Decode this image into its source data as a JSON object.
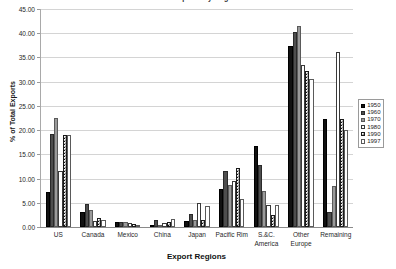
{
  "chart_data": {
    "type": "bar",
    "title": "U.S. Exports by Region",
    "xlabel": "Export Regions",
    "ylabel": "% of Total Exports",
    "ylim": [
      0,
      45
    ],
    "ytick_step": 5,
    "ytick_labels": [
      "0.00",
      "5.00",
      "10.00",
      "15.00",
      "20.00",
      "25.00",
      "30.00",
      "35.00",
      "40.00",
      "45.00"
    ],
    "ytick_values": [
      0,
      5,
      10,
      15,
      20,
      25,
      30,
      35,
      40,
      45
    ],
    "grid": true,
    "legend_position": "right",
    "categories": [
      "US",
      "Canada",
      "Mexico",
      "China",
      "Japan",
      "Pacific Rim",
      "S.&C. America",
      "Other Europe",
      "Remaining"
    ],
    "series": [
      {
        "name": "1950",
        "values": [
          7.2,
          3.2,
          1.1,
          0.0,
          1.2,
          7.9,
          16.8,
          37.3,
          22.3
        ]
      },
      {
        "name": "1960",
        "values": [
          19.3,
          4.7,
          1.0,
          1.5,
          2.7,
          11.5,
          12.8,
          40.3,
          3.1
        ]
      },
      {
        "name": "1970",
        "values": [
          22.6,
          3.5,
          1.0,
          0.2,
          1.5,
          8.6,
          7.4,
          41.4,
          8.4
        ]
      },
      {
        "name": "1980",
        "values": [
          11.5,
          1.3,
          0.8,
          0.9,
          5.0,
          9.5,
          4.5,
          33.5,
          36.2
        ]
      },
      {
        "name": "1990",
        "values": [
          18.9,
          1.9,
          0.7,
          1.0,
          1.5,
          12.2,
          2.5,
          32.3,
          22.4
        ]
      },
      {
        "name": "1997",
        "values": [
          18.9,
          1.5,
          0.5,
          1.7,
          4.3,
          5.7,
          4.5,
          30.5,
          20.1
        ]
      }
    ],
    "series_styles": [
      "solid-black",
      "dark-gray",
      "medium-gray",
      "white",
      "checkered",
      "light-dotted"
    ]
  },
  "legend": {
    "items": [
      {
        "label": "1950"
      },
      {
        "label": "1960"
      },
      {
        "label": "1970"
      },
      {
        "label": "1980"
      },
      {
        "label": "1990"
      },
      {
        "label": "1997"
      }
    ]
  },
  "colors": {
    "series_1950": "#111111",
    "series_1960": "#4e4e4e",
    "series_1970": "#9a9a9a",
    "series_1980": "#ffffff",
    "series_1990": "#111111",
    "series_1997": "#555555",
    "gridline": "#d4d4d4",
    "axis": "#8a8a8a",
    "text": "#1f1f1f",
    "background": "#ffffff"
  }
}
